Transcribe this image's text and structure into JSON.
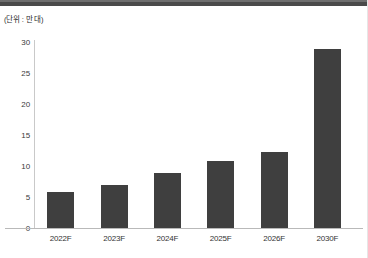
{
  "figure": {
    "unit_note": "(단위 : 만 대)",
    "bar_color": "#3f3f3f",
    "axis_color": "#c9c9c9",
    "background": "#ffffff"
  },
  "chart_data": {
    "type": "bar",
    "title": "",
    "subtitle": "",
    "xlabel": "",
    "ylabel": "",
    "unit_label": "(단위 : 만 대)",
    "categories": [
      "2022F",
      "2023F",
      "2024F",
      "2025F",
      "2026F",
      "2030F"
    ],
    "values": [
      5.8,
      6.9,
      8.9,
      10.8,
      12.3,
      28.8
    ],
    "series": [
      {
        "name": "",
        "values": [
          5.8,
          6.9,
          8.9,
          10.8,
          12.3,
          28.8
        ]
      }
    ],
    "ylim": [
      0,
      30
    ],
    "yticks": [
      0,
      5,
      10,
      15,
      20,
      25,
      30
    ],
    "ytick_labels": [
      "0",
      "5",
      "10",
      "15",
      "20",
      "25",
      "30"
    ],
    "grid": false,
    "legend": false,
    "legend_position": "none",
    "bar_color": "#3f3f3f",
    "annotations": []
  }
}
